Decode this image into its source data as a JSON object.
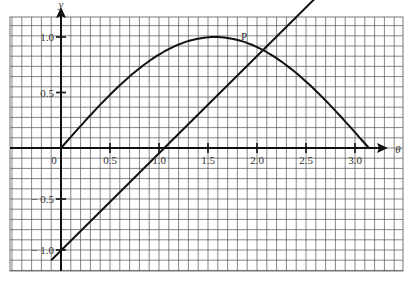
{
  "figure": {
    "y_axis_label": "y",
    "x_axis_label": "θ",
    "point_label": "P",
    "origin_label": "0",
    "x_ticks": [
      {
        "value": 0.5,
        "label": "0.5"
      },
      {
        "value": 1.0,
        "label": "1.0"
      },
      {
        "value": 1.5,
        "label": "1.5"
      },
      {
        "value": 2.0,
        "label": "2.0"
      },
      {
        "value": 2.5,
        "label": "2.5"
      },
      {
        "value": 3.0,
        "label": "3.0"
      }
    ],
    "y_ticks": [
      {
        "value": 1.0,
        "label": "1.0"
      },
      {
        "value": 0.5,
        "label": "0.5"
      },
      {
        "value": -0.5,
        "label": "− 0.5"
      },
      {
        "value": -1.0,
        "label": "− 1.0"
      }
    ],
    "colors": {
      "grid": "#555555",
      "curve": "#111111",
      "background": "#ffffff"
    }
  },
  "chart_data": {
    "type": "line",
    "title": "",
    "xlabel": "θ",
    "ylabel": "y",
    "xlim": [
      -0.5,
      3.5
    ],
    "ylim": [
      -1.15,
      1.1
    ],
    "grid": true,
    "series": [
      {
        "name": "y = sin θ",
        "x": [
          0,
          0.25,
          0.5,
          0.75,
          1.0,
          1.25,
          1.5,
          1.57,
          1.75,
          2.0,
          2.25,
          2.5,
          2.75,
          3.0,
          3.14
        ],
        "y": [
          0,
          0.25,
          0.48,
          0.68,
          0.84,
          0.95,
          1.0,
          1.0,
          0.98,
          0.91,
          0.78,
          0.6,
          0.38,
          0.14,
          0
        ]
      },
      {
        "name": "y = θ − 1",
        "x": [
          -0.1,
          3.6
        ],
        "y": [
          -1.1,
          2.6
        ]
      }
    ],
    "annotations": [
      {
        "label": "P",
        "x": 1.93,
        "y": 0.93
      }
    ]
  }
}
